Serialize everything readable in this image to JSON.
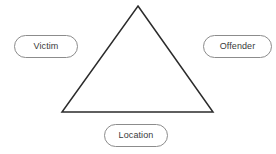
{
  "diagram": {
    "background_color": "#ffffff",
    "shape": {
      "name": "triangle",
      "type": "triangle-outline",
      "stroke_color": "#2b2b2b",
      "stroke_width": 1.5,
      "fill": "none",
      "vertices": {
        "apex": {
          "x": 138,
          "y": 6
        },
        "bottom_left": {
          "x": 62,
          "y": 112
        },
        "bottom_right": {
          "x": 213,
          "y": 112
        }
      }
    },
    "nodes": [
      {
        "id": "victim",
        "label": "Victim",
        "position": "left",
        "border_color": "#8c8c8c",
        "fill_color": "#ffffff",
        "text_color": "#3a3a3a"
      },
      {
        "id": "offender",
        "label": "Offender",
        "position": "right",
        "border_color": "#8c8c8c",
        "fill_color": "#ffffff",
        "text_color": "#3a3a3a"
      },
      {
        "id": "location",
        "label": "Location",
        "position": "bottom-center",
        "border_color": "#8c8c8c",
        "fill_color": "#ffffff",
        "text_color": "#3a3a3a"
      }
    ]
  }
}
